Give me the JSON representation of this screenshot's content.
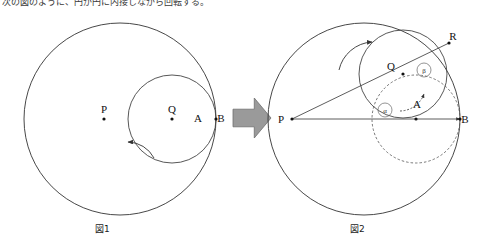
{
  "page": {
    "width": 480,
    "height": 247,
    "background": "#ffffff",
    "top_text": "次の図のように、円が円に内接しながら回転する。"
  },
  "colors": {
    "stroke": "#333333",
    "thin_stroke": "#555555",
    "dashed": "#555555",
    "arrow_fill": "#9a9a9a",
    "arrow_stroke": "#6e6e6e",
    "text": "#111111"
  },
  "figure1": {
    "caption": "図1",
    "big_circle": {
      "cx": 120,
      "cy": 119,
      "r": 96
    },
    "small_circle": {
      "cx": 172,
      "cy": 119,
      "r": 44
    },
    "points": [
      {
        "name": "P",
        "label": "P",
        "cx": 104,
        "cy": 119,
        "label_dx": -4,
        "label_dy": -6
      },
      {
        "name": "Q",
        "label": "Q",
        "cx": 172,
        "cy": 119,
        "label_dx": -4,
        "label_dy": -6
      },
      {
        "name": "AB",
        "label": "",
        "cx": 216,
        "cy": 119,
        "label_dx": 0,
        "label_dy": 0
      }
    ],
    "text_labels": [
      {
        "name": "label-A",
        "text": "A",
        "x": 198,
        "y": 122
      },
      {
        "name": "label-B",
        "text": "B",
        "x": 221,
        "y": 122
      }
    ],
    "rotation_arrow": {
      "name": "rotation-arrow-ccw",
      "path": "M 154 158 A 30 30 0 0 0 128 142"
    }
  },
  "transition_arrow": {
    "name": "transition-arrow",
    "label": "",
    "x": 233,
    "y": 98,
    "width": 38,
    "height": 40
  },
  "figure2": {
    "caption": "図2",
    "big_circle": {
      "cx": 364,
      "cy": 119,
      "r": 96
    },
    "rolled_circle": {
      "cx": 403,
      "cy": 74,
      "r": 44
    },
    "dashed_circle": {
      "cx": 416,
      "cy": 119,
      "r": 44
    },
    "radius_line": {
      "x1": 292,
      "y1": 119,
      "x2": 449,
      "y2": 43
    },
    "horizontal_line": {
      "x1": 292,
      "y1": 119,
      "x2": 460,
      "y2": 119
    },
    "points": [
      {
        "name": "P",
        "label": "P",
        "cx": 292,
        "cy": 119,
        "label_dx": -11,
        "label_dy": 4
      },
      {
        "name": "Q",
        "label": "Q",
        "cx": 403,
        "cy": 74,
        "label_dx": -12,
        "label_dy": -4
      },
      {
        "name": "R",
        "label": "R",
        "cx": 449,
        "cy": 43,
        "label_dx": 4,
        "label_dy": -3
      },
      {
        "name": "A",
        "label": "A",
        "cx": 418,
        "cy": 100,
        "label_dx": -1,
        "label_dy": 8
      },
      {
        "name": "B",
        "label": "B",
        "cx": 460,
        "cy": 119,
        "label_dx": 5,
        "label_dy": 4
      },
      {
        "name": "C",
        "label": "",
        "cx": 416,
        "cy": 119,
        "label_dx": 0,
        "label_dy": 0
      }
    ],
    "angles": [
      {
        "name": "angle-alpha",
        "label": "α",
        "cx": 385,
        "cy": 110,
        "r": 7
      },
      {
        "name": "angle-beta",
        "label": "β",
        "cx": 424,
        "cy": 70,
        "r": 7
      }
    ],
    "rotation_arrow": {
      "name": "rotation-arrow-cw",
      "path": "M 339 70 A 36 36 0 0 1 372 42"
    },
    "arc_arrow_inner": {
      "name": "arc-marker-inner",
      "path": "M 400 111 A 26 26 0 0 0 424 94"
    }
  }
}
